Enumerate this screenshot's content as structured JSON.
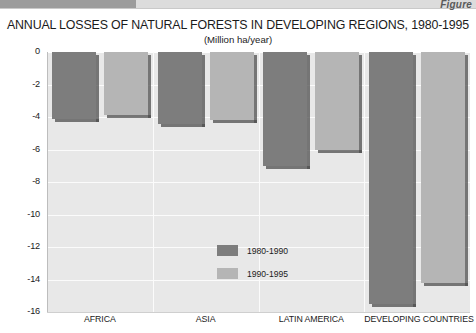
{
  "banner": {
    "figure_label": "Figure"
  },
  "chart_data": {
    "type": "bar",
    "title": "ANNUAL LOSSES OF NATURAL FORESTS IN DEVELOPING REGIONS, 1980-1995",
    "subtitle": "(Million ha/year)",
    "xlabel": "",
    "ylabel": "",
    "ylim": [
      -16,
      0
    ],
    "yticks": [
      0,
      -2,
      -4,
      -6,
      -8,
      -10,
      -12,
      -14,
      -16
    ],
    "ytick_labels": [
      "0",
      "-2",
      "-4",
      "-6",
      "-8",
      "-10",
      "-12",
      "-14",
      "-16"
    ],
    "grid": true,
    "legend_position": "center",
    "categories": [
      "AFRICA",
      "ASIA",
      "LATIN AMERICA",
      "DEVELOPING COUNTRIES"
    ],
    "series": [
      {
        "name": "1980-1990",
        "color": "#7d7d7d",
        "values": [
          -4.1,
          -4.4,
          -7.0,
          -15.5
        ]
      },
      {
        "name": "1990-1995",
        "color": "#b5b5b5",
        "values": [
          -3.9,
          -4.2,
          -6.0,
          -14.2
        ]
      }
    ]
  },
  "colors": {
    "plot_background": "#e8e8e8",
    "gridline": "#fbfbfb",
    "series_1980_1990": "#7d7d7d",
    "series_1990_1995": "#b5b5b5",
    "text": "#1b1b1b"
  }
}
